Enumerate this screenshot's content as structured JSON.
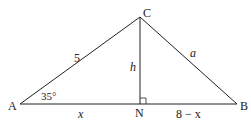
{
  "diagram": {
    "type": "triangle",
    "vertices": {
      "A": "A",
      "B": "B",
      "C": "C",
      "N": "N"
    },
    "labels": {
      "side_AC": "5",
      "side_CB": "a",
      "altitude_CN": "h",
      "angle_A": "35°",
      "segment_AN": "x",
      "segment_NB": "8 − x"
    },
    "right_angle_at": "N",
    "colors": {
      "stroke": "#222222"
    }
  }
}
